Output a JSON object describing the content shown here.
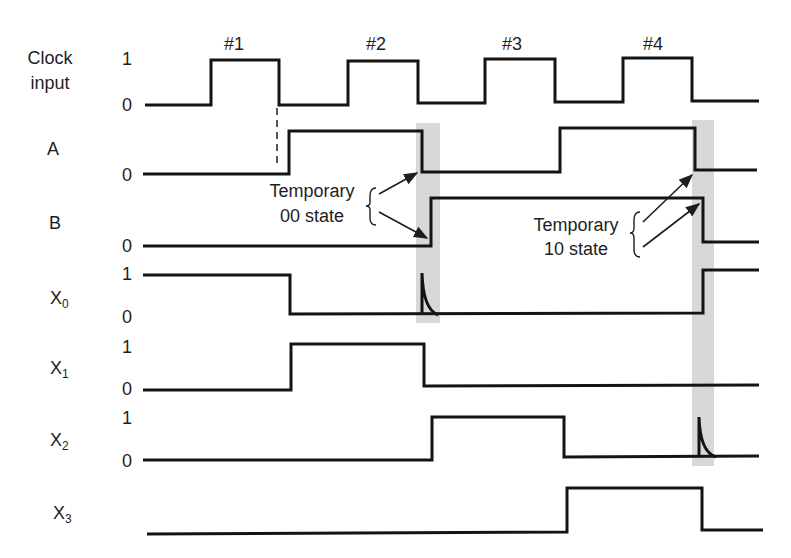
{
  "diagram": {
    "colors": {
      "line": "#141414",
      "highlight_band": "#d8d8d8",
      "text": "#1e1e1e"
    }
  },
  "clock_pulses": [
    {
      "label": "#1",
      "x": 234
    },
    {
      "label": "#2",
      "x": 376
    },
    {
      "label": "#3",
      "x": 512
    },
    {
      "label": "#4",
      "x": 653
    }
  ],
  "signals": [
    {
      "id": "clock",
      "label_line1": "Clock",
      "label_line2": "input",
      "levels": {
        "one": "1",
        "zero": "0"
      },
      "logic": [
        0,
        1,
        0,
        1,
        0,
        1,
        0,
        1,
        0
      ],
      "points": [
        [
          145,
          105
        ],
        [
          211,
          105
        ],
        [
          211,
          60
        ],
        [
          279,
          60
        ],
        [
          279,
          105
        ],
        [
          348,
          105
        ],
        [
          348,
          61
        ],
        [
          418,
          61
        ],
        [
          418,
          103
        ],
        [
          485,
          103
        ],
        [
          485,
          59
        ],
        [
          555,
          59
        ],
        [
          555,
          102
        ],
        [
          623,
          102
        ],
        [
          623,
          58
        ],
        [
          692,
          58
        ],
        [
          692,
          101
        ],
        [
          759,
          101
        ]
      ]
    },
    {
      "id": "A",
      "label": "A",
      "levels": {
        "zero": "0"
      },
      "logic": [
        0,
        1,
        0,
        1,
        0
      ],
      "points": [
        [
          143,
          174
        ],
        [
          289,
          174
        ],
        [
          289,
          131
        ],
        [
          422,
          131
        ],
        [
          422,
          172
        ],
        [
          560,
          172
        ],
        [
          560,
          128
        ],
        [
          695,
          128
        ],
        [
          695,
          170
        ],
        [
          757,
          170
        ]
      ]
    },
    {
      "id": "B",
      "label": "B",
      "levels": {
        "zero": "0"
      },
      "logic": [
        0,
        1,
        0
      ],
      "points": [
        [
          143,
          246
        ],
        [
          431,
          246
        ],
        [
          431,
          198
        ],
        [
          703,
          198
        ],
        [
          703,
          242
        ],
        [
          759,
          242
        ]
      ]
    },
    {
      "id": "X0",
      "label": "X",
      "subscript": "0",
      "levels": {
        "one": "1",
        "zero": "0"
      },
      "logic": [
        1,
        0,
        1
      ],
      "points": [
        [
          143,
          275
        ],
        [
          290,
          275
        ],
        [
          290,
          314
        ],
        [
          703,
          313
        ],
        [
          703,
          270
        ],
        [
          759,
          270
        ]
      ],
      "glitch": "M422,314 L422,273 Q423,309 438,315"
    },
    {
      "id": "X1",
      "label": "X",
      "subscript": "1",
      "levels": {
        "one": "1",
        "zero": "0"
      },
      "logic": [
        0,
        1,
        0
      ],
      "points": [
        [
          143,
          390
        ],
        [
          291,
          390
        ],
        [
          291,
          344
        ],
        [
          424,
          344
        ],
        [
          424,
          386
        ],
        [
          759,
          385
        ]
      ]
    },
    {
      "id": "X2",
      "label": "X",
      "subscript": "2",
      "levels": {
        "one": "1",
        "zero": "0"
      },
      "logic": [
        0,
        1,
        0
      ],
      "points": [
        [
          143,
          460
        ],
        [
          432,
          460
        ],
        [
          432,
          417
        ],
        [
          564,
          417
        ],
        [
          564,
          457
        ],
        [
          759,
          456
        ]
      ],
      "glitch": "M699,457 L699,417 Q700,452 716,457"
    },
    {
      "id": "X3",
      "label": "X",
      "subscript": "3",
      "levels": {},
      "logic": [
        0,
        1,
        0
      ],
      "points": [
        [
          147,
          534
        ],
        [
          567,
          532
        ],
        [
          567,
          488
        ],
        [
          702,
          488
        ],
        [
          702,
          530
        ],
        [
          763,
          530
        ]
      ]
    }
  ],
  "annotations": [
    {
      "line1": "Temporary",
      "line2": "00 state"
    },
    {
      "line1": "Temporary",
      "line2": "10 state"
    }
  ]
}
